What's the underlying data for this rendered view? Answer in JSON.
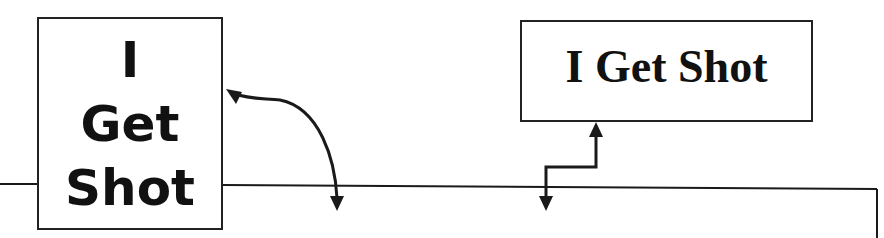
{
  "diagram": {
    "left_box": {
      "lines": [
        "I",
        "Get",
        "Shot"
      ]
    },
    "right_box": {
      "title": "I Get Shot"
    },
    "connectors": [
      {
        "name": "curved-bidirectional-arrow",
        "from": "left_box",
        "to": "bottom-container"
      },
      {
        "name": "elbow-bidirectional-arrow",
        "from": "right_box",
        "to": "bottom-container"
      }
    ],
    "colors": {
      "stroke": "#1a1a1a",
      "background": "#ffffff"
    }
  }
}
